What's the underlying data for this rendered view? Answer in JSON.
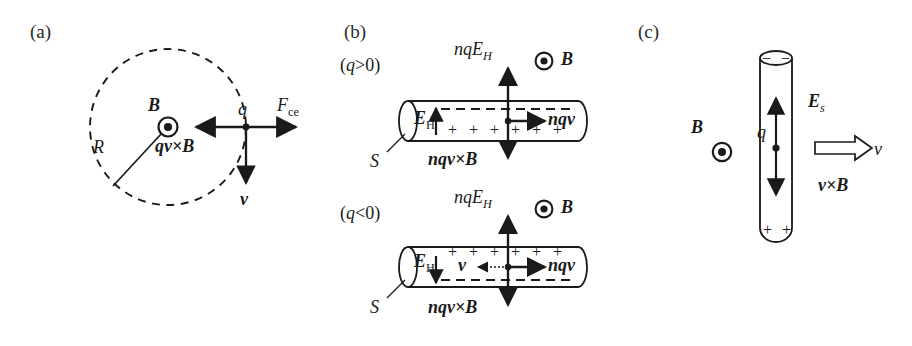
{
  "figure": {
    "background": "#ffffff",
    "ink": "#1a1a1a",
    "width": 912,
    "height": 346
  },
  "panels": {
    "a": {
      "tag": "(a)",
      "labels": {
        "B": "B",
        "R": "R",
        "q": "q",
        "force_centrifugal": "F",
        "force_centrifugal_sub": "ce",
        "lorentz": "qv×B",
        "velocity": "v"
      },
      "geometry": {
        "circle_center_x": 168,
        "circle_center_y": 127,
        "circle_radius": 78,
        "dashed": true
      },
      "icons": {
        "b_out_of_page": "circle-dot-icon"
      }
    },
    "b": {
      "tag": "(b)",
      "cases": [
        {
          "id": "positive",
          "condition": "(q>0)",
          "labels": {
            "nqE_H": "nqE",
            "nqE_H_sub": "H",
            "B": "B",
            "E_H": "E",
            "E_H_sub": "H",
            "nqv": "nqv",
            "nqvxB": "nqv×B",
            "S": "S"
          },
          "charge_top": "− − − − − −",
          "charge_bottom": "+ + + + + +",
          "E_H_direction": "up",
          "current_direction": "right",
          "has_v_arrow": false
        },
        {
          "id": "negative",
          "condition": "(q<0)",
          "labels": {
            "nqE_H": "nqE",
            "nqE_H_sub": "H",
            "B": "B",
            "E_H": "E",
            "E_H_sub": "H",
            "nqv": "nqv",
            "v": "v",
            "nqvxB": "nqv×B",
            "S": "S"
          },
          "charge_top": "+ + + + + +",
          "charge_bottom": "− − − − − −",
          "E_H_direction": "down",
          "current_direction": "right",
          "has_v_arrow": true
        }
      ]
    },
    "c": {
      "tag": "(c)",
      "labels": {
        "B": "B",
        "q": "q",
        "E_s": "E",
        "E_s_sub": "s",
        "v": "v",
        "vxB": "v×B"
      },
      "charge_top": "− −",
      "charge_bottom": "+ +",
      "icons": {
        "b_out_of_page": "circle-dot-icon",
        "velocity_arrow": "hollow-arrow-icon"
      }
    }
  }
}
